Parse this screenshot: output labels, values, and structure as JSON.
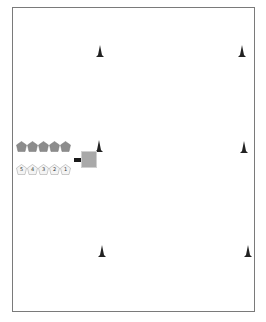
{
  "diagram": {
    "type": "field-layout",
    "border_color": "#7a7a7a",
    "cone_color": "#222222",
    "cones": [
      {
        "id": "cone-top-left",
        "x": 96,
        "y": 45
      },
      {
        "id": "cone-top-right",
        "x": 238,
        "y": 45
      },
      {
        "id": "cone-mid-left",
        "x": 95,
        "y": 140
      },
      {
        "id": "cone-mid-right",
        "x": 240,
        "y": 141
      },
      {
        "id": "cone-bottom-left",
        "x": 98,
        "y": 245
      },
      {
        "id": "cone-bottom-right",
        "x": 244,
        "y": 245
      }
    ],
    "gray_team": {
      "color": "#8c8c8c",
      "players": [
        {
          "label": "",
          "x": 16,
          "y": 141
        },
        {
          "label": "",
          "x": 27,
          "y": 141
        },
        {
          "label": "",
          "x": 38,
          "y": 141
        },
        {
          "label": "",
          "x": 49,
          "y": 141
        },
        {
          "label": "",
          "x": 60,
          "y": 141
        }
      ]
    },
    "white_team": {
      "color": "#f4f4f4",
      "players": [
        {
          "label": "5",
          "x": 16,
          "y": 164
        },
        {
          "label": "4",
          "x": 27,
          "y": 164
        },
        {
          "label": "3",
          "x": 38,
          "y": 164
        },
        {
          "label": "2",
          "x": 49,
          "y": 164
        },
        {
          "label": "1",
          "x": 60,
          "y": 164
        }
      ]
    },
    "marker_bar": {
      "color": "#1a1a1a"
    },
    "gray_square": {
      "color": "#a9a9a9"
    }
  }
}
